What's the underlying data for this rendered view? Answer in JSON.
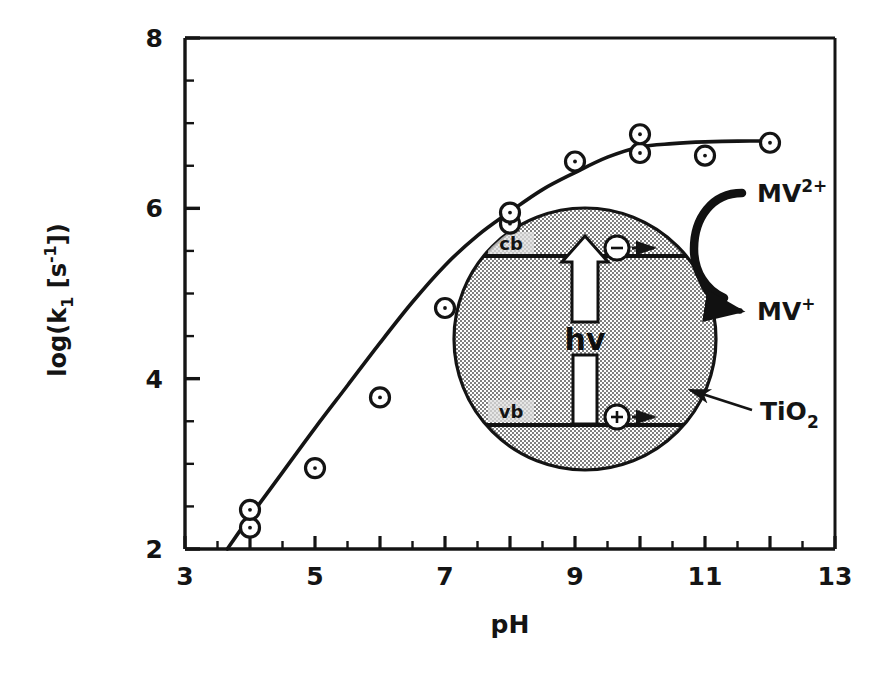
{
  "chart_data": {
    "type": "scatter",
    "title": "",
    "xlabel": "pH",
    "ylabel": "log(k1 [s-1])",
    "ylabel_parts": {
      "prefix": "log(k",
      "sub1": "1",
      "mid": " [s",
      "sup1": "-1",
      "suffix": "])"
    },
    "xlim": [
      3,
      13
    ],
    "ylim": [
      2,
      8
    ],
    "xticks": [
      3,
      5,
      7,
      9,
      11,
      13
    ],
    "xtick_labels": [
      "3",
      "5",
      "7",
      "9",
      "11",
      "13"
    ],
    "yticks": [
      2,
      4,
      6,
      8
    ],
    "ytick_labels": [
      "2",
      "4",
      "6",
      "8"
    ],
    "xtick_minor_step": 0.5,
    "ytick_minor_step": 0.5,
    "grid": false,
    "legend": "none",
    "marker": "open-circle-with-dot",
    "x": [
      4.0,
      4.0,
      5.0,
      6.0,
      7.0,
      8.0,
      8.0,
      9.0,
      10.0,
      10.0,
      11.0,
      12.0
    ],
    "y": [
      2.25,
      2.46,
      2.95,
      3.78,
      4.83,
      5.82,
      5.95,
      6.55,
      6.65,
      6.87,
      6.62,
      6.77
    ],
    "points": [
      {
        "x": 4.0,
        "y": 2.25
      },
      {
        "x": 4.0,
        "y": 2.46
      },
      {
        "x": 5.0,
        "y": 2.95
      },
      {
        "x": 6.0,
        "y": 3.78
      },
      {
        "x": 7.0,
        "y": 4.83
      },
      {
        "x": 8.0,
        "y": 5.82
      },
      {
        "x": 8.0,
        "y": 5.95
      },
      {
        "x": 9.0,
        "y": 6.55
      },
      {
        "x": 10.0,
        "y": 6.65
      },
      {
        "x": 10.0,
        "y": 6.87
      },
      {
        "x": 11.0,
        "y": 6.62
      },
      {
        "x": 12.0,
        "y": 6.77
      }
    ],
    "fit_curve": [
      {
        "x": 3.65,
        "y": 2.0
      },
      {
        "x": 4.0,
        "y": 2.38
      },
      {
        "x": 4.5,
        "y": 2.9
      },
      {
        "x": 5.0,
        "y": 3.42
      },
      {
        "x": 5.5,
        "y": 3.92
      },
      {
        "x": 6.0,
        "y": 4.42
      },
      {
        "x": 6.5,
        "y": 4.9
      },
      {
        "x": 7.0,
        "y": 5.33
      },
      {
        "x": 7.5,
        "y": 5.68
      },
      {
        "x": 8.0,
        "y": 5.96
      },
      {
        "x": 8.5,
        "y": 6.22
      },
      {
        "x": 9.0,
        "y": 6.42
      },
      {
        "x": 9.5,
        "y": 6.6
      },
      {
        "x": 10.0,
        "y": 6.72
      },
      {
        "x": 10.5,
        "y": 6.76
      },
      {
        "x": 11.0,
        "y": 6.78
      },
      {
        "x": 11.5,
        "y": 6.79
      },
      {
        "x": 12.0,
        "y": 6.79
      }
    ]
  },
  "inset": {
    "name": "TiO2 particle photoexcitation scheme",
    "conduction_band_label": "cb",
    "valence_band_label": "vb",
    "photon_label": "hv",
    "electron_symbol": "−",
    "hole_symbol": "+",
    "particle_label": "TiO",
    "particle_label_sub": "2",
    "reactant_label": "MV",
    "reactant_label_sup": "2+",
    "product_label": "MV",
    "product_label_sup": "+"
  },
  "colors": {
    "ink": "#141414",
    "background": "#ffffff",
    "particle_fill": "#c9c9c9",
    "band_line": "#111111"
  }
}
